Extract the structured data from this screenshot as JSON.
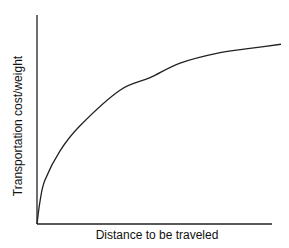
{
  "chart_data": {
    "type": "line",
    "title": "",
    "xlabel": "Distance to be traveled",
    "ylabel": "Transportation cost/weight",
    "grid": false,
    "legend": null,
    "ticks": false,
    "x": [
      0,
      0.013,
      0.034,
      0.098,
      0.183,
      0.353,
      0.481,
      0.609,
      0.779,
      0.906,
      1.038
    ],
    "series": [
      {
        "name": "cost curve",
        "values": [
          0,
          0.11,
          0.21,
          0.35,
          0.47,
          0.64,
          0.7,
          0.77,
          0.82,
          0.84,
          0.86
        ]
      }
    ]
  },
  "labels": {
    "x_axis": "Distance to be traveled",
    "y_axis": "Transportation cost/weight"
  }
}
